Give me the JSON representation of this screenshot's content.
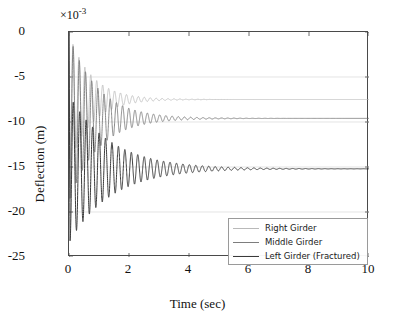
{
  "chart_data": {
    "type": "line",
    "title": "",
    "xlabel": "Time (sec)",
    "ylabel": "Deflection (m)",
    "y_multiplier": "×10",
    "y_multiplier_exponent": "-3",
    "xlim": [
      0,
      10
    ],
    "ylim": [
      -25,
      0
    ],
    "xticks": [
      0,
      2,
      4,
      6,
      8,
      10
    ],
    "yticks": [
      0,
      -5,
      -10,
      -15,
      -20,
      -25
    ],
    "xtick_labels": [
      "0",
      "2",
      "4",
      "6",
      "8",
      "10"
    ],
    "ytick_labels": [
      "0",
      "-5",
      "-10",
      "-15",
      "-20",
      "-25"
    ],
    "grid": true,
    "legend_position": "bottom-right",
    "series": [
      {
        "name": "Right Girder",
        "color": "#b9b9b9",
        "line_width": 0.8,
        "steady_state": -7.5,
        "initial_peak": -14.5,
        "damping": 1.35,
        "frequency_hz": 5.05,
        "settle_time_sec": 3.6
      },
      {
        "name": "Middle Girder",
        "color": "#7d7d7d",
        "line_width": 0.9,
        "steady_state": -9.6,
        "initial_peak": -18.5,
        "damping": 1.05,
        "frequency_hz": 4.85,
        "settle_time_sec": 4.6
      },
      {
        "name": "Left Girder (Fractured)",
        "color": "#3a3a3a",
        "line_width": 1.0,
        "steady_state": -15.2,
        "initial_peak": -23.2,
        "damping": 0.72,
        "frequency_hz": 4.65,
        "settle_time_sec": 6.5
      }
    ]
  },
  "legend": {
    "items": [
      {
        "label": "Right Girder",
        "color": "#b9b9b9",
        "width": "1px"
      },
      {
        "label": "Middle Girder",
        "color": "#7d7d7d",
        "width": "1.4px"
      },
      {
        "label": "Left Girder (Fractured)",
        "color": "#3a3a3a",
        "width": "1.8px"
      }
    ]
  },
  "colors": {
    "frame": "#4a4a4a",
    "grid": "#d8d8d8",
    "background": "#ffffff",
    "text": "#111111"
  }
}
